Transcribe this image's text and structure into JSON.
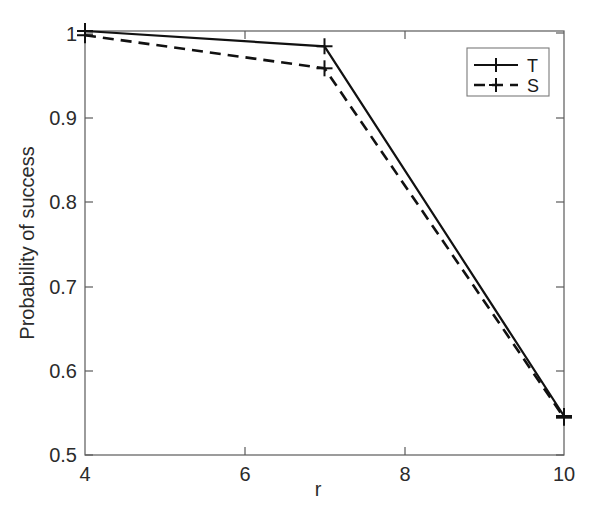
{
  "chart_data": {
    "type": "line",
    "title": "",
    "xlabel": "r",
    "ylabel": "Probability of success",
    "xlim": [
      4,
      10
    ],
    "ylim": [
      0.5,
      1.0
    ],
    "xticks": [
      4,
      6,
      8,
      10
    ],
    "xtick_labels": [
      "4",
      "6",
      "8",
      "10"
    ],
    "yticks": [
      0.5,
      0.6,
      0.7,
      0.8,
      0.9,
      1.0
    ],
    "ytick_labels": [
      "0.5",
      "0.6",
      "0.7",
      "0.8",
      "0.9",
      "1"
    ],
    "grid": false,
    "legend_position": "upper right",
    "series": [
      {
        "name": "T",
        "linestyle": "solid",
        "marker": "plus",
        "color": "#111111",
        "x": [
          4,
          7,
          10
        ],
        "values": [
          1.0,
          0.982,
          0.546
        ]
      },
      {
        "name": "S",
        "linestyle": "dashed",
        "marker": "plus",
        "color": "#111111",
        "x": [
          4,
          7,
          10
        ],
        "values": [
          0.995,
          0.956,
          0.544
        ]
      }
    ]
  },
  "axis": {
    "xlabel": "r",
    "ylabel": "Probability of success",
    "xtick_0": "4",
    "xtick_1": "6",
    "xtick_2": "8",
    "xtick_3": "10",
    "ytick_0": "0.5",
    "ytick_1": "0.6",
    "ytick_2": "0.7",
    "ytick_3": "0.8",
    "ytick_4": "0.9",
    "ytick_5": "1"
  },
  "legend": {
    "entry_0": "T",
    "entry_1": "S"
  }
}
